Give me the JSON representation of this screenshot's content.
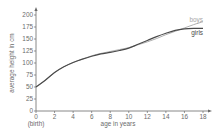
{
  "chart_data": {
    "type": "line",
    "title": "",
    "xlabel": "age in years",
    "ylabel": "average height in cm",
    "x_extra_label": "(birth)",
    "xlim": [
      0,
      18
    ],
    "ylim": [
      0,
      200
    ],
    "x_ticks": [
      0,
      2,
      4,
      6,
      8,
      10,
      12,
      14,
      16,
      18
    ],
    "y_ticks": [
      0,
      25,
      50,
      75,
      100,
      125,
      150,
      175,
      200
    ],
    "grid": false,
    "legend": "inline labels at line ends",
    "x": [
      0,
      1,
      2,
      3,
      4,
      5,
      6,
      7,
      8,
      9,
      10,
      11,
      12,
      13,
      14,
      15,
      16,
      17,
      18
    ],
    "series": [
      {
        "name": "boys",
        "color": "#a6a6a6",
        "values": [
          50,
          64,
          80,
          92,
          101,
          108,
          115,
          120,
          124,
          128,
          132,
          138,
          144,
          151,
          159,
          166,
          173,
          180,
          186
        ]
      },
      {
        "name": "girls",
        "color": "#4a4a4a",
        "values": [
          50,
          64,
          80,
          92,
          101,
          108,
          114,
          119,
          122,
          126,
          131,
          139,
          147,
          155,
          162,
          168,
          171,
          172,
          172
        ]
      }
    ]
  }
}
